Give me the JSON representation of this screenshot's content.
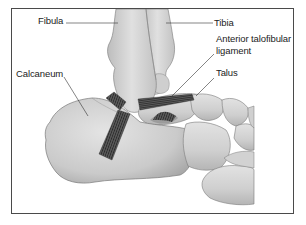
{
  "diagram": {
    "labels": {
      "fibula": "Fibula",
      "tibia": "Tibia",
      "atfl_line1": "Anterior talofibular",
      "atfl_line2": "ligament",
      "talus": "Talus",
      "calcaneum": "Calcaneum"
    },
    "colors": {
      "frame": "#4a4a4a",
      "bone_light": "#dcdcdc",
      "bone_mid": "#c4c4c4",
      "bone_shadow": "#a8a8a8",
      "bone_outline": "#7a7a7a",
      "ligament": "#4a4a4a",
      "ligament_stripe": "#2a2a2a",
      "leader_line": "#333333",
      "text": "#222222"
    }
  }
}
